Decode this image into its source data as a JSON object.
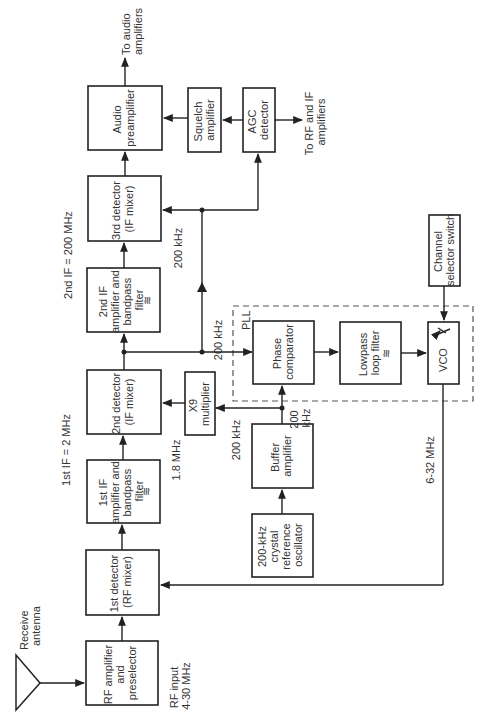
{
  "diagram": {
    "orientation": "rotated 90 degrees counter-clockwise",
    "blocks": {
      "rf_amp": [
        "RF amplifier",
        "and",
        "preselector"
      ],
      "det1": [
        "1st detector",
        "(RF mixer)"
      ],
      "if1": [
        "1st IF",
        "amplifier and",
        "bandpass",
        "filter"
      ],
      "det2": [
        "2nd detector",
        "(IF mixer)"
      ],
      "if2": [
        "2nd IF",
        "amplifier and",
        "bandpass",
        "filter"
      ],
      "det3": [
        "3rd detector",
        "(IF mixer)"
      ],
      "audio_pre": [
        "Audio",
        "preamplifier"
      ],
      "squelch": [
        "Squelch",
        "amplifier"
      ],
      "agc": [
        "AGC",
        "detector"
      ],
      "x9": [
        "X9",
        "multiplier"
      ],
      "buffer": [
        "Buffer",
        "amplifier"
      ],
      "xtal": [
        "200-kHz",
        "crystal",
        "reference",
        "oscillator"
      ],
      "phase_comp": [
        "Phase",
        "comparator"
      ],
      "lpf": [
        "Lowpass",
        "loop filter"
      ],
      "vco": [
        "VCO"
      ],
      "chan_sel": [
        "Channel",
        "selector switch"
      ]
    },
    "filter_symbol": "≋",
    "labels": {
      "antenna": [
        "Receive",
        "antenna"
      ],
      "rf_input": [
        "RF input",
        "4-30 MHz"
      ],
      "if1_freq": "1st IF = 2 MHz",
      "if2_freq": "2nd IF = 200 MHz",
      "x9_out": "1.8 MHz",
      "x9_in": "200 kHz",
      "buffer_out": [
        "200",
        "kHz"
      ],
      "to_det3_low": "200 kHz",
      "to_det3_high": "200 kHz",
      "vco_out": "6-32 MHz",
      "pll": "PLL",
      "to_audio": [
        "To audio",
        "amplifiers"
      ],
      "to_rf_if": [
        "To RF and IF",
        "amplifiers"
      ]
    }
  }
}
